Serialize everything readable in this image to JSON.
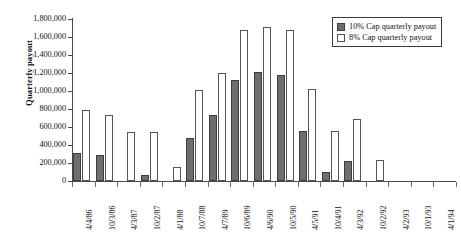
{
  "chart_data": {
    "type": "bar",
    "title": "",
    "subtitle": "",
    "xlabel": "",
    "ylabel": "Quarterly payout",
    "ylim": [
      0,
      1800000
    ],
    "ytick_step": 200000,
    "ytick_labels": [
      "1,800,000",
      "1,600,000",
      "1,400,000",
      "1,200,000",
      "1,000,000",
      "800,000",
      "600,000",
      "400,000",
      "200,000",
      "0"
    ],
    "ytick_values": [
      1800000,
      1600000,
      1400000,
      1200000,
      1000000,
      800000,
      600000,
      400000,
      200000,
      0
    ],
    "grid": false,
    "legend_position": "top-right",
    "categories": [
      "4/4/86",
      "10/3/86",
      "4/3/87",
      "10/2/87",
      "4/1/88",
      "10/7/88",
      "4/7/89",
      "10/6/89",
      "4/6/90",
      "10/5/90",
      "4/5/91",
      "10/4/91",
      "4/3/92",
      "10/2/92",
      "4/2/93",
      "10/1/93",
      "4/1/94"
    ],
    "series": [
      {
        "name": "10% Cap quarterly payout",
        "color": "#6e6e6e",
        "values": [
          310000,
          290000,
          0,
          70000,
          0,
          480000,
          730000,
          1120000,
          1210000,
          1180000,
          560000,
          100000,
          220000,
          0,
          0,
          0,
          0
        ]
      },
      {
        "name": "8% Cap quarterly payout",
        "color": "#ffffff",
        "values": [
          790000,
          730000,
          540000,
          550000,
          160000,
          1010000,
          1200000,
          1680000,
          1710000,
          1680000,
          1020000,
          560000,
          690000,
          230000,
          0,
          0,
          0
        ]
      }
    ]
  },
  "legend": {
    "items": [
      {
        "label": "10% Cap quarterly payout",
        "style": "dark"
      },
      {
        "label": "8% Cap quarterly payout",
        "style": "light"
      }
    ]
  }
}
